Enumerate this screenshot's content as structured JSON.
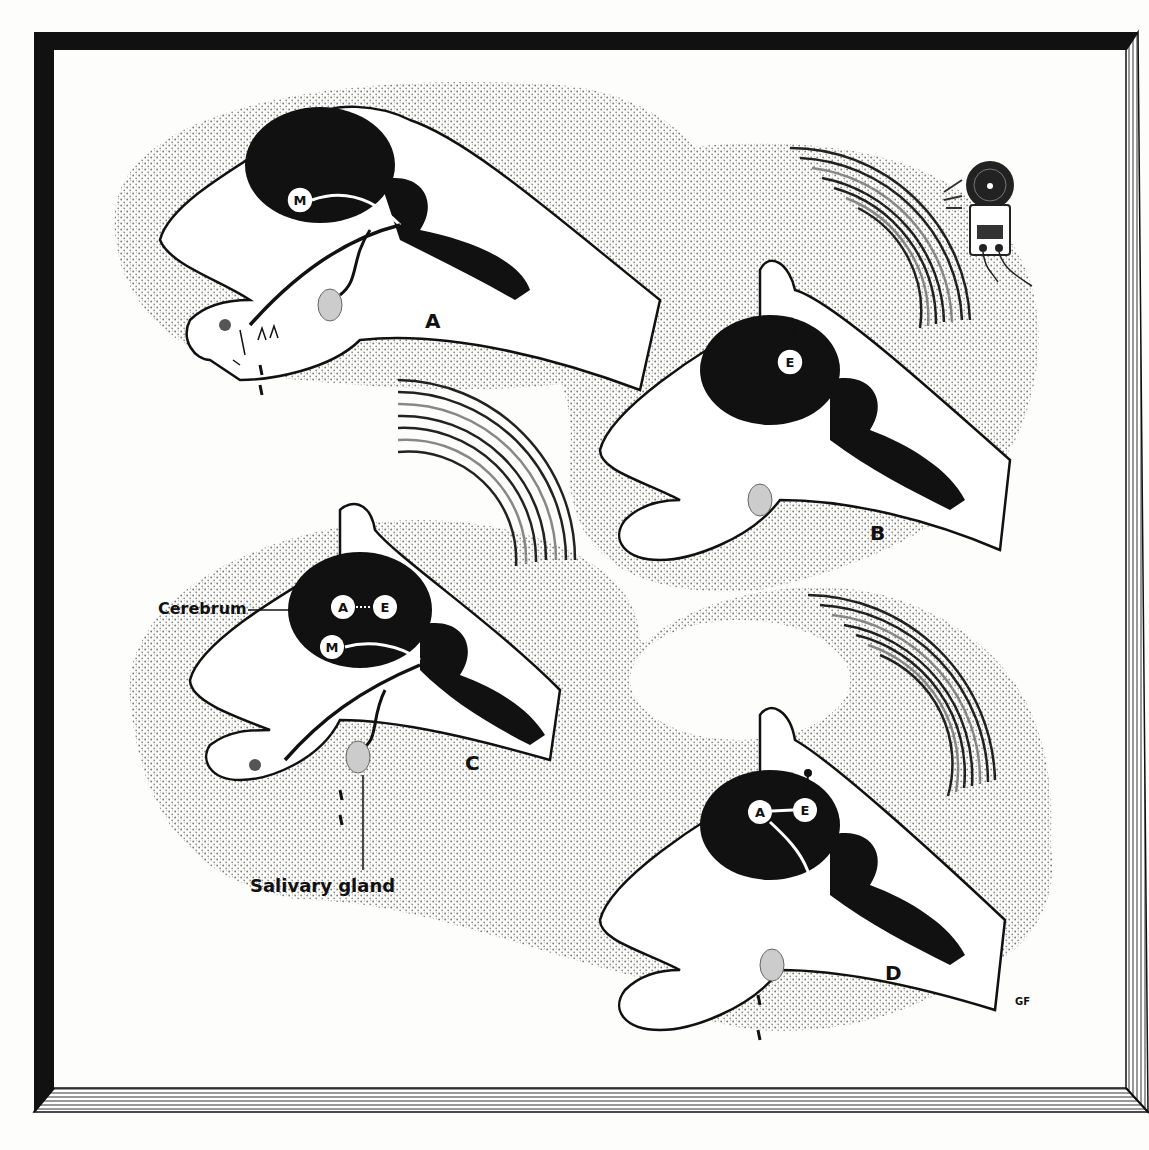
{
  "figure": {
    "type": "illustration",
    "colors": {
      "background": "#fdfdfb",
      "frame": "#111111",
      "stipple": "#9a9a9a",
      "ink": "#111111",
      "head": "#ffffff"
    }
  },
  "panels": [
    {
      "id": "A",
      "label": "A",
      "brain_centers": [
        "M"
      ],
      "description": "Unconditioned reflex: food in mouth, saliva drips"
    },
    {
      "id": "B",
      "label": "B",
      "brain_centers": [
        "E"
      ],
      "description": "Bell sound only: ear center E excited, no salivation"
    },
    {
      "id": "C",
      "label": "C",
      "brain_centers": [
        "A",
        "E",
        "M"
      ],
      "description": "Bell paired with food: salivation"
    },
    {
      "id": "D",
      "label": "D",
      "brain_centers": [
        "A",
        "E"
      ],
      "description": "Conditioned reflex: bell alone causes salivation"
    }
  ],
  "annotations": {
    "cerebrum": "Cerebrum",
    "salivary_gland": "Salivary gland",
    "signature": "GF"
  },
  "centers": {
    "M": "M",
    "E": "E",
    "A": "A"
  },
  "icons": [
    "bell-icon",
    "sound-waves-icon"
  ]
}
